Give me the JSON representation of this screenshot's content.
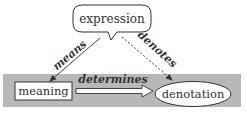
{
  "diagram": {
    "nodes": {
      "expression": {
        "label": "expression",
        "shape": "speech-bubble"
      },
      "meaning": {
        "label": "meaning",
        "shape": "rectangle"
      },
      "denotation": {
        "label": "denotation",
        "shape": "ellipse"
      }
    },
    "edges": {
      "means": {
        "label": "means",
        "from": "expression",
        "to": "meaning",
        "style": "solid"
      },
      "denotes": {
        "label": "denotes",
        "from": "expression",
        "to": "denotation",
        "style": "dashed"
      },
      "determines": {
        "label": "determines",
        "from": "meaning",
        "to": "denotation",
        "style": "hollow-arrow"
      }
    },
    "colors": {
      "band": "#b8b8b8",
      "stroke": "#333333",
      "text": "#333333",
      "fill": "#ffffff"
    }
  }
}
